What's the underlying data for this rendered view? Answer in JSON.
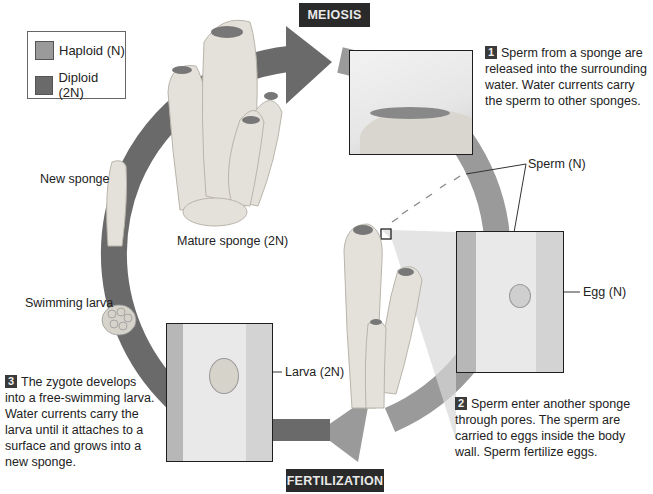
{
  "diagram": {
    "stages": {
      "top": "MEIOSIS",
      "bottom": "FERTILIZATION"
    },
    "legend": [
      {
        "label": "Haploid (N)",
        "color": "#9a9a9a"
      },
      {
        "label": "Diploid (2N)",
        "color": "#6a6a6a"
      }
    ],
    "labels": {
      "new_sponge": "New sponge",
      "mature_sponge": "Mature sponge (2N)",
      "swimming_larva": "Swimming larva",
      "sperm": "Sperm (N)",
      "egg": "Egg (N)",
      "larva": "Larva (2N)"
    },
    "steps": [
      {
        "number": "1",
        "text": "Sperm from a sponge are released into the surrounding water. Water currents carry the sperm to other sponges."
      },
      {
        "number": "2",
        "text": "Sperm enter another sponge through pores. The sperm are carried to eggs inside the body wall. Sperm fertilize eggs."
      },
      {
        "number": "3",
        "text": "The zygote develops into a free-swimming larva. Water currents carry the larva until it attaches to a surface and grows into a new sponge."
      }
    ],
    "colors": {
      "haploid_arrow": "#9a9a9a",
      "diploid_arrow": "#6a6a6a",
      "stage_bg": "#2a2a2a",
      "stage_text": "#e9e9e9"
    }
  }
}
